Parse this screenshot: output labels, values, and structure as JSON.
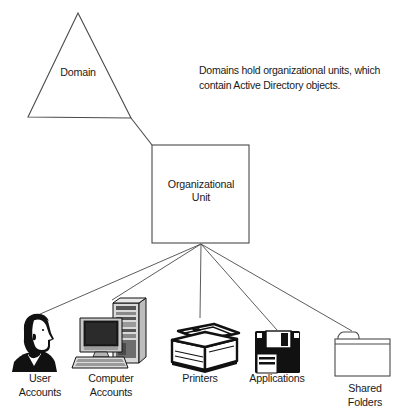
{
  "diagram": {
    "caption": "Domains hold organizational units, which contain Active Directory objects.",
    "domain": {
      "label": "Domain",
      "shape": "triangle"
    },
    "organizational_unit": {
      "label": "Organizational\nUnit",
      "shape": "rectangle"
    },
    "objects": [
      {
        "id": "user-accounts",
        "label": "User\nAccounts",
        "icon": "user-head-icon"
      },
      {
        "id": "computer-accounts",
        "label": "Computer\nAccounts",
        "icon": "computer-tower-icon"
      },
      {
        "id": "printers",
        "label": "Printers",
        "icon": "printer-icon"
      },
      {
        "id": "applications",
        "label": "Applications",
        "icon": "floppy-disk-icon"
      },
      {
        "id": "shared-folders",
        "label": "Shared\nFolders",
        "icon": "folder-icon"
      }
    ],
    "colors": {
      "stroke": "#4a4a4a",
      "ink": "#1a1a1a",
      "background": "#ffffff",
      "icon_dark": "#111111",
      "icon_mid": "#7a7a7a",
      "icon_light": "#d4d4d4"
    }
  }
}
